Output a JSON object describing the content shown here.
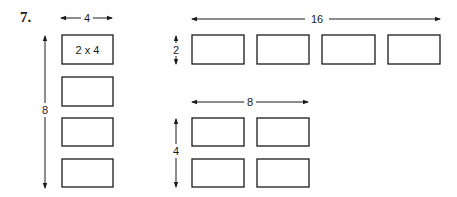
{
  "problem_number": "7.",
  "left_group": {
    "width_label": "4",
    "height_label": "8",
    "first_rect_label": "2 x 4",
    "rect_count": 4
  },
  "top_right_group": {
    "width_label": "16",
    "height_label": "2",
    "rect_count": 4
  },
  "bottom_right_group": {
    "width_label": "8",
    "height_label": "4",
    "rect_count": 4
  },
  "colors": {
    "ink": "#1a1a1a",
    "background": "#ffffff"
  }
}
